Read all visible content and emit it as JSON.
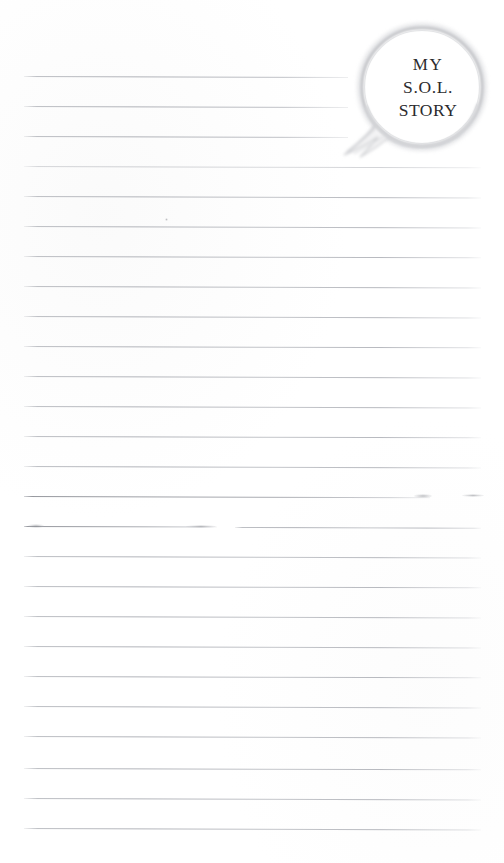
{
  "page": {
    "title": "My S.O.L. Story",
    "kind": "lined-notebook-page",
    "width": 504,
    "height": 863,
    "background_color": "#ffffff"
  },
  "speech_bubble": {
    "name": "speech-bubble",
    "outline_color": "#c9cacd",
    "fill_color": "#ffffff",
    "text_color": "#2b2b2e",
    "lines": [
      {
        "text": "MY"
      },
      {
        "text": "S.O.L."
      },
      {
        "text": "STORY"
      }
    ]
  },
  "ruled_lines": {
    "count": 27,
    "color": "#b4b6bc",
    "first_y": 76,
    "spacing": 30,
    "left_x": 24,
    "right_x": 481,
    "truncated_right_x": 348,
    "items": [
      {
        "index": 1,
        "y": 76,
        "x": 24,
        "w": 324,
        "style": "short"
      },
      {
        "index": 2,
        "y": 106,
        "x": 24,
        "w": 324,
        "style": "short"
      },
      {
        "index": 3,
        "y": 136,
        "x": 24,
        "w": 324,
        "style": "short"
      },
      {
        "index": 4,
        "y": 166,
        "x": 24,
        "w": 457,
        "style": "faint"
      },
      {
        "index": 5,
        "y": 196,
        "x": 24,
        "w": 457,
        "style": "normal"
      },
      {
        "index": 6,
        "y": 226,
        "x": 24,
        "w": 457,
        "style": "normal"
      },
      {
        "index": 7,
        "y": 256,
        "x": 24,
        "w": 457,
        "style": "normal"
      },
      {
        "index": 8,
        "y": 286,
        "x": 24,
        "w": 457,
        "style": "normal"
      },
      {
        "index": 9,
        "y": 316,
        "x": 24,
        "w": 457,
        "style": "normal"
      },
      {
        "index": 10,
        "y": 346,
        "x": 24,
        "w": 457,
        "style": "normal"
      },
      {
        "index": 11,
        "y": 376,
        "x": 24,
        "w": 457,
        "style": "normal"
      },
      {
        "index": 12,
        "y": 406,
        "x": 24,
        "w": 457,
        "style": "normal"
      },
      {
        "index": 13,
        "y": 436,
        "x": 24,
        "w": 457,
        "style": "normal"
      },
      {
        "index": 14,
        "y": 466,
        "x": 24,
        "w": 457,
        "style": "normal"
      },
      {
        "index": 15,
        "y": 496,
        "x": 24,
        "w": 406,
        "style": "strong"
      },
      {
        "index": 16,
        "y": 526,
        "x": 24,
        "w": 193,
        "style": "strong"
      },
      {
        "index": 17,
        "y": 527,
        "x": 235,
        "w": 246,
        "style": "normal"
      },
      {
        "index": 18,
        "y": 556,
        "x": 24,
        "w": 457,
        "style": "normal"
      },
      {
        "index": 19,
        "y": 586,
        "x": 24,
        "w": 457,
        "style": "normal"
      },
      {
        "index": 20,
        "y": 616,
        "x": 24,
        "w": 457,
        "style": "normal"
      },
      {
        "index": 21,
        "y": 646,
        "x": 24,
        "w": 457,
        "style": "normal"
      },
      {
        "index": 22,
        "y": 676,
        "x": 24,
        "w": 457,
        "style": "normal"
      },
      {
        "index": 23,
        "y": 706,
        "x": 24,
        "w": 457,
        "style": "normal"
      },
      {
        "index": 24,
        "y": 736,
        "x": 24,
        "w": 457,
        "style": "normal"
      },
      {
        "index": 25,
        "y": 768,
        "x": 24,
        "w": 457,
        "style": "normal"
      },
      {
        "index": 26,
        "y": 798,
        "x": 24,
        "w": 457,
        "style": "normal"
      },
      {
        "index": 27,
        "y": 828,
        "x": 24,
        "w": 457,
        "style": "normal"
      }
    ]
  },
  "scan_artifacts": [
    {
      "name": "smudge-right-dash",
      "x": 462,
      "y": 494,
      "w": 22,
      "h": 3
    },
    {
      "name": "smudge-line-end",
      "x": 414,
      "y": 494,
      "w": 18,
      "h": 4
    },
    {
      "name": "smudge-left-blob",
      "x": 28,
      "y": 524,
      "w": 16,
      "h": 4
    },
    {
      "name": "smudge-mid-fade",
      "x": 186,
      "y": 525,
      "w": 30,
      "h": 3
    },
    {
      "name": "speck-upper",
      "x": 165,
      "y": 218,
      "w": 3,
      "h": 3
    }
  ]
}
